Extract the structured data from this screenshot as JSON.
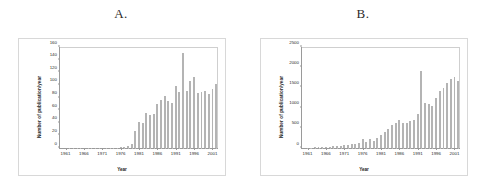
{
  "figure": {
    "background": "#ffffff",
    "bar_color": "#b4b4b4",
    "axis_color": "#9a9a9a",
    "frame_color": "#d8d8d8"
  },
  "panels": [
    {
      "letter": "A.",
      "name": "panel-a"
    },
    {
      "letter": "B.",
      "name": "panel-b"
    }
  ],
  "chart_data": [
    {
      "type": "bar",
      "panel": "A",
      "title": "A.",
      "xlabel": "Year",
      "ylabel": "Number of publication/year",
      "ylim": [
        0,
        160
      ],
      "yticks": [
        0,
        20,
        40,
        60,
        80,
        100,
        120,
        140,
        160
      ],
      "ytick_labels": [
        "0",
        "20",
        "40",
        "60",
        "80",
        "100",
        "120",
        "140",
        "160"
      ],
      "xticks": [
        1961,
        1966,
        1971,
        1976,
        1981,
        1986,
        1991,
        1996,
        2001
      ],
      "xtick_labels": [
        "1961",
        "1966",
        "1971",
        "1976",
        "1981",
        "1986",
        "1991",
        "1996",
        "2001"
      ],
      "xlim": [
        1960,
        2002
      ],
      "grid": false,
      "legend": null,
      "categories": [
        1961,
        1962,
        1963,
        1964,
        1965,
        1966,
        1967,
        1968,
        1969,
        1970,
        1971,
        1972,
        1973,
        1974,
        1975,
        1976,
        1977,
        1978,
        1979,
        1980,
        1981,
        1982,
        1983,
        1984,
        1985,
        1986,
        1987,
        1988,
        1989,
        1990,
        1991,
        1992,
        1993,
        1994,
        1995,
        1996,
        1997,
        1998,
        1999,
        2000,
        2001,
        2002
      ],
      "values": [
        0,
        0,
        0,
        0,
        0,
        0,
        0,
        0,
        0,
        0,
        0,
        0,
        0,
        0,
        0,
        1,
        2,
        3,
        7,
        27,
        42,
        39,
        56,
        53,
        54,
        69,
        76,
        82,
        75,
        71,
        99,
        89,
        150,
        90,
        106,
        113,
        87,
        88,
        90,
        86,
        94,
        101,
        97,
        38
      ]
    },
    {
      "type": "bar",
      "panel": "B",
      "title": "B.",
      "xlabel": "Year",
      "ylabel": "Number of publication/year",
      "ylim": [
        0,
        2500
      ],
      "yticks": [
        0,
        500,
        1000,
        1500,
        2000,
        2500
      ],
      "ytick_labels": [
        "0",
        "500",
        "1000",
        "1500",
        "2000",
        "2500"
      ],
      "xticks": [
        1961,
        1966,
        1971,
        1976,
        1981,
        1986,
        1991,
        1996,
        2001
      ],
      "xtick_labels": [
        "1961",
        "1966",
        "1971",
        "1976",
        "1981",
        "1986",
        "1991",
        "1996",
        "2001"
      ],
      "xlim": [
        1960,
        2002
      ],
      "grid": false,
      "legend": null,
      "categories": [
        1961,
        1962,
        1963,
        1964,
        1965,
        1966,
        1967,
        1968,
        1969,
        1970,
        1971,
        1972,
        1973,
        1974,
        1975,
        1976,
        1977,
        1978,
        1979,
        1980,
        1981,
        1982,
        1983,
        1984,
        1985,
        1986,
        1987,
        1988,
        1989,
        1990,
        1991,
        1992,
        1993,
        1994,
        1995,
        1996,
        1997,
        1998,
        1999,
        2000,
        2001,
        2002
      ],
      "values": [
        10,
        12,
        15,
        18,
        22,
        30,
        35,
        45,
        55,
        60,
        70,
        80,
        95,
        110,
        130,
        215,
        160,
        230,
        175,
        255,
        330,
        400,
        470,
        560,
        610,
        690,
        620,
        610,
        660,
        690,
        840,
        1900,
        1110,
        1080,
        1040,
        1230,
        1400,
        1490,
        1610,
        1700,
        1750,
        1660,
        400
      ]
    }
  ]
}
